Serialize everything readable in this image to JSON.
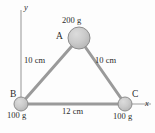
{
  "figure": {
    "background_color": "#fdfdfd",
    "axes": {
      "y_label": "y",
      "x_label": "x",
      "axis_color": "#b4b4b4",
      "origin": {
        "x": 21,
        "y": 104
      }
    },
    "masses": [
      {
        "vertex": "A",
        "mass_label": "200 g",
        "center": {
          "x": 79,
          "y": 38
        },
        "radius": 11,
        "fill": "#c9c9c9",
        "stroke": "#8d8d8d"
      },
      {
        "vertex": "B",
        "mass_label": "100 g",
        "center": {
          "x": 21,
          "y": 104
        },
        "radius": 7,
        "fill": "#c9c9c9",
        "stroke": "#8d8d8d"
      },
      {
        "vertex": "C",
        "mass_label": "100 g",
        "center": {
          "x": 125,
          "y": 104
        },
        "radius": 7,
        "fill": "#c9c9c9",
        "stroke": "#8d8d8d"
      }
    ],
    "sides": [
      {
        "name": "AB",
        "length_label": "10 cm",
        "from": "B",
        "to": "A"
      },
      {
        "name": "AC",
        "length_label": "10 cm",
        "from": "A",
        "to": "C"
      },
      {
        "name": "BC",
        "length_label": "12 cm",
        "from": "B",
        "to": "C"
      }
    ],
    "side_color": "#9a9a9a"
  }
}
